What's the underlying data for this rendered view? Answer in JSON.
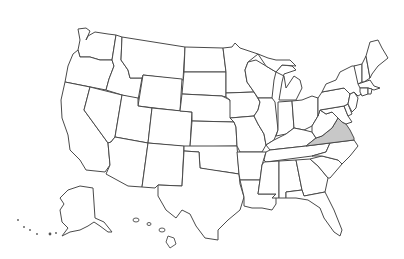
{
  "map": {
    "title": "",
    "type": "us-states-outline",
    "highlight_color": "#c8c8c8",
    "stroke_color": "#4a4a4a",
    "background": "#ffffff",
    "highlighted_states": [
      "Virginia"
    ],
    "states": [
      {
        "name": "Washington",
        "highlighted": false
      },
      {
        "name": "Oregon",
        "highlighted": false
      },
      {
        "name": "California",
        "highlighted": false
      },
      {
        "name": "Idaho",
        "highlighted": false
      },
      {
        "name": "Nevada",
        "highlighted": false
      },
      {
        "name": "Montana",
        "highlighted": false
      },
      {
        "name": "Wyoming",
        "highlighted": false
      },
      {
        "name": "Utah",
        "highlighted": false
      },
      {
        "name": "Arizona",
        "highlighted": false
      },
      {
        "name": "Colorado",
        "highlighted": false
      },
      {
        "name": "New Mexico",
        "highlighted": false
      },
      {
        "name": "North Dakota",
        "highlighted": false
      },
      {
        "name": "South Dakota",
        "highlighted": false
      },
      {
        "name": "Nebraska",
        "highlighted": false
      },
      {
        "name": "Kansas",
        "highlighted": false
      },
      {
        "name": "Oklahoma",
        "highlighted": false
      },
      {
        "name": "Texas",
        "highlighted": false
      },
      {
        "name": "Minnesota",
        "highlighted": false
      },
      {
        "name": "Iowa",
        "highlighted": false
      },
      {
        "name": "Missouri",
        "highlighted": false
      },
      {
        "name": "Arkansas",
        "highlighted": false
      },
      {
        "name": "Louisiana",
        "highlighted": false
      },
      {
        "name": "Wisconsin",
        "highlighted": false
      },
      {
        "name": "Illinois",
        "highlighted": false
      },
      {
        "name": "Michigan",
        "highlighted": false
      },
      {
        "name": "Indiana",
        "highlighted": false
      },
      {
        "name": "Ohio",
        "highlighted": false
      },
      {
        "name": "Kentucky",
        "highlighted": false
      },
      {
        "name": "Tennessee",
        "highlighted": false
      },
      {
        "name": "Mississippi",
        "highlighted": false
      },
      {
        "name": "Alabama",
        "highlighted": false
      },
      {
        "name": "Georgia",
        "highlighted": false
      },
      {
        "name": "Florida",
        "highlighted": false
      },
      {
        "name": "South Carolina",
        "highlighted": false
      },
      {
        "name": "North Carolina",
        "highlighted": false
      },
      {
        "name": "Virginia",
        "highlighted": true
      },
      {
        "name": "West Virginia",
        "highlighted": false
      },
      {
        "name": "Maryland",
        "highlighted": false
      },
      {
        "name": "Delaware",
        "highlighted": false
      },
      {
        "name": "Pennsylvania",
        "highlighted": false
      },
      {
        "name": "New Jersey",
        "highlighted": false
      },
      {
        "name": "New York",
        "highlighted": false
      },
      {
        "name": "Connecticut",
        "highlighted": false
      },
      {
        "name": "Rhode Island",
        "highlighted": false
      },
      {
        "name": "Massachusetts",
        "highlighted": false
      },
      {
        "name": "Vermont",
        "highlighted": false
      },
      {
        "name": "New Hampshire",
        "highlighted": false
      },
      {
        "name": "Maine",
        "highlighted": false
      },
      {
        "name": "Alaska",
        "highlighted": false
      },
      {
        "name": "Hawaii",
        "highlighted": false
      }
    ]
  }
}
